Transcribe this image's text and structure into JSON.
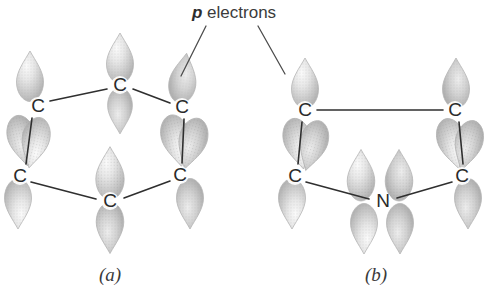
{
  "figure": {
    "title_annotation": {
      "italic_part": "p",
      "plain_part": " electrons",
      "full_text": "p electrons",
      "x": 192,
      "y": 14
    },
    "background_color": "#ffffff",
    "ink_color": "#2f2f2f",
    "lobe_fill_light": "#f2f2f2",
    "lobe_fill_mid": "#c9c9c9",
    "lobe_fill_dark": "#9a9a9a",
    "lobe_stroke": "#b3b3b3",
    "width": 487,
    "height": 298
  },
  "leader_lines": [
    {
      "name": "leader-to-structure-a",
      "x1": 206,
      "y1": 26,
      "x2": 181,
      "y2": 76
    },
    {
      "name": "leader-to-structure-b",
      "x1": 258,
      "y1": 26,
      "x2": 285,
      "y2": 74
    }
  ],
  "structures": [
    {
      "id": "a",
      "caption": "(a)",
      "caption_x": 110,
      "caption_y": 277,
      "ring_name": "benzene-ring",
      "atoms": [
        {
          "name": "atom-a-c-top",
          "label": "C",
          "x": 120,
          "y": 85
        },
        {
          "name": "atom-a-c-upper-left",
          "label": "C",
          "x": 38,
          "y": 106
        },
        {
          "name": "atom-a-c-upper-right",
          "label": "C",
          "x": 182,
          "y": 107
        },
        {
          "name": "atom-a-c-lower-left",
          "label": "C",
          "x": 20,
          "y": 176
        },
        {
          "name": "atom-a-c-lower-right",
          "label": "C",
          "x": 180,
          "y": 175
        },
        {
          "name": "atom-a-c-bottom",
          "label": "C",
          "x": 110,
          "y": 201
        }
      ],
      "bonds": [
        {
          "name": "bond-a-1",
          "x1": 50,
          "y1": 101,
          "x2": 107,
          "y2": 89
        },
        {
          "name": "bond-a-2",
          "x1": 133,
          "y1": 89,
          "x2": 170,
          "y2": 103
        },
        {
          "name": "bond-a-3",
          "x1": 32,
          "y1": 118,
          "x2": 26,
          "y2": 164
        },
        {
          "name": "bond-a-4",
          "x1": 184,
          "y1": 119,
          "x2": 182,
          "y2": 163
        },
        {
          "name": "bond-a-5",
          "x1": 31,
          "y1": 182,
          "x2": 96,
          "y2": 199
        },
        {
          "name": "bond-a-6",
          "x1": 124,
          "y1": 198,
          "x2": 170,
          "y2": 181
        }
      ],
      "lobes": [
        {
          "name": "lobe-a-top-c-up",
          "cx": 120,
          "cy": 59,
          "rot": 0,
          "scale": 1.0
        },
        {
          "name": "lobe-a-top-c-down",
          "cx": 120,
          "cy": 110,
          "rot": 180,
          "scale": 0.92
        },
        {
          "name": "lobe-a-upper-left-up",
          "cx": 30,
          "cy": 77,
          "rot": 0,
          "scale": 1.0
        },
        {
          "name": "lobe-a-upper-left-down-1",
          "cx": 22,
          "cy": 140,
          "rot": 168,
          "scale": 1.02
        },
        {
          "name": "lobe-a-upper-left-down-2",
          "cx": 35,
          "cy": 142,
          "rot": 193,
          "scale": 1.02
        },
        {
          "name": "lobe-a-upper-right-up",
          "cx": 183,
          "cy": 79,
          "rot": 8,
          "scale": 1.0
        },
        {
          "name": "lobe-a-upper-right-down-1",
          "cx": 176,
          "cy": 140,
          "rot": 168,
          "scale": 1.04
        },
        {
          "name": "lobe-a-upper-right-down-2",
          "cx": 192,
          "cy": 143,
          "rot": 196,
          "scale": 1.04
        },
        {
          "name": "lobe-a-lower-left-down",
          "cx": 18,
          "cy": 203,
          "rot": 180,
          "scale": 1.0
        },
        {
          "name": "lobe-a-lower-right-down",
          "cx": 190,
          "cy": 203,
          "rot": 180,
          "scale": 1.0
        },
        {
          "name": "lobe-a-bottom-c-up",
          "cx": 110,
          "cy": 174,
          "rot": 0,
          "scale": 1.05
        },
        {
          "name": "lobe-a-bottom-c-down",
          "cx": 110,
          "cy": 227,
          "rot": 180,
          "scale": 1.02
        }
      ]
    },
    {
      "id": "b",
      "caption": "(b)",
      "caption_x": 376,
      "caption_y": 277,
      "ring_name": "pyrrole-ring",
      "atoms": [
        {
          "name": "atom-b-c-top-left",
          "label": "C",
          "x": 305,
          "y": 110
        },
        {
          "name": "atom-b-c-top-right",
          "label": "C",
          "x": 455,
          "y": 110
        },
        {
          "name": "atom-b-c-lower-left",
          "label": "C",
          "x": 295,
          "y": 176
        },
        {
          "name": "atom-b-c-lower-right",
          "label": "C",
          "x": 462,
          "y": 176
        },
        {
          "name": "atom-b-n-bottom",
          "label": "N",
          "x": 383,
          "y": 201
        }
      ],
      "bonds": [
        {
          "name": "bond-b-1",
          "x1": 317,
          "y1": 110,
          "x2": 443,
          "y2": 110
        },
        {
          "name": "bond-b-2",
          "x1": 302,
          "y1": 122,
          "x2": 298,
          "y2": 164
        },
        {
          "name": "bond-b-3",
          "x1": 459,
          "y1": 122,
          "x2": 463,
          "y2": 164
        },
        {
          "name": "bond-b-4",
          "x1": 306,
          "y1": 182,
          "x2": 369,
          "y2": 199
        },
        {
          "name": "bond-b-5",
          "x1": 397,
          "y1": 198,
          "x2": 452,
          "y2": 182
        }
      ],
      "lobes": [
        {
          "name": "lobe-b-top-left-up",
          "cx": 305,
          "cy": 84,
          "rot": 0,
          "scale": 1.0
        },
        {
          "name": "lobe-b-top-right-up",
          "cx": 456,
          "cy": 84,
          "rot": 0,
          "scale": 1.0
        },
        {
          "name": "lobe-b-top-left-down-1",
          "cx": 298,
          "cy": 143,
          "rot": 168,
          "scale": 1.02
        },
        {
          "name": "lobe-b-top-left-down-2",
          "cx": 313,
          "cy": 145,
          "rot": 196,
          "scale": 1.02
        },
        {
          "name": "lobe-b-top-right-down-1",
          "cx": 452,
          "cy": 143,
          "rot": 165,
          "scale": 1.02
        },
        {
          "name": "lobe-b-top-right-down-2",
          "cx": 468,
          "cy": 145,
          "rot": 195,
          "scale": 1.02
        },
        {
          "name": "lobe-b-lower-left-down",
          "cx": 292,
          "cy": 203,
          "rot": 180,
          "scale": 1.0
        },
        {
          "name": "lobe-b-lower-right-down",
          "cx": 468,
          "cy": 203,
          "rot": 180,
          "scale": 1.0
        },
        {
          "name": "lobe-b-nitrogen-up-left",
          "cx": 361,
          "cy": 176,
          "rot": 0,
          "scale": 1.02
        },
        {
          "name": "lobe-b-nitrogen-up-right",
          "cx": 399,
          "cy": 176,
          "rot": 0,
          "scale": 1.02
        },
        {
          "name": "lobe-b-nitrogen-down-left",
          "cx": 364,
          "cy": 228,
          "rot": 180,
          "scale": 1.0
        },
        {
          "name": "lobe-b-nitrogen-down-right",
          "cx": 400,
          "cy": 228,
          "rot": 180,
          "scale": 1.0
        }
      ]
    }
  ]
}
